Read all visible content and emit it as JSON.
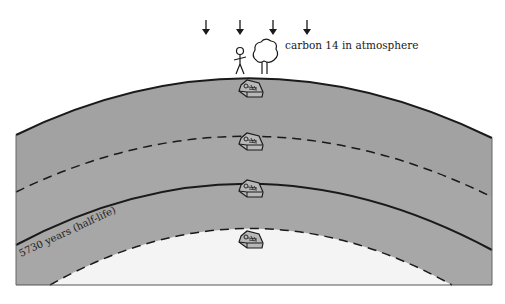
{
  "diagram": {
    "atmosphere_label": "carbon 14 in atmosphere",
    "half_life_label": "5730 years (half-life)",
    "arrows": [
      {
        "name": "carbon-arrow-1",
        "x": 206
      },
      {
        "name": "carbon-arrow-2",
        "x": 240
      },
      {
        "name": "carbon-arrow-3",
        "x": 273
      },
      {
        "name": "carbon-arrow-4",
        "x": 307
      }
    ],
    "surface_objects": [
      "person",
      "tree"
    ],
    "coffins": [
      {
        "name": "coffin-surface-layer",
        "y": 90
      },
      {
        "name": "coffin-layer-2",
        "y": 143
      },
      {
        "name": "coffin-layer-3",
        "y": 190
      },
      {
        "name": "coffin-layer-4",
        "y": 241
      }
    ],
    "colors": {
      "ground": "#a8a8a8",
      "ground_top": "#a2a2a2",
      "deep": "#f4f4f4",
      "line": "#1a1a1a"
    }
  }
}
